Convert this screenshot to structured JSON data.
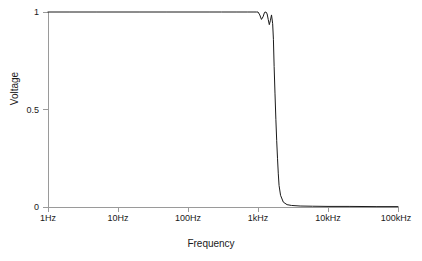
{
  "chart_data": {
    "type": "line",
    "title": "",
    "xlabel": "Frequency",
    "ylabel": "Voltage",
    "xscale": "log",
    "xlim": [
      1,
      100000
    ],
    "ylim": [
      0,
      1
    ],
    "grid": false,
    "legend": null,
    "xtick_labels": [
      "1Hz",
      "10Hz",
      "100Hz",
      "1kHz",
      "10kHz",
      "100kHz"
    ],
    "xtick_values": [
      1,
      10,
      100,
      1000,
      10000,
      100000
    ],
    "ytick_labels": [
      "0",
      "0.5",
      "1"
    ],
    "ytick_values": [
      0,
      0.5,
      1
    ],
    "line_color": "#1a1a1a",
    "line_width": 1,
    "series": [
      {
        "name": "Voltage response",
        "x": [
          1,
          2,
          5,
          10,
          20,
          50,
          100,
          200,
          300,
          500,
          700,
          850,
          950,
          1000,
          1060,
          1120,
          1180,
          1240,
          1300,
          1350,
          1400,
          1450,
          1500,
          1560,
          1620,
          1660,
          1700,
          1750,
          1800,
          1850,
          1900,
          1950,
          2000,
          2100,
          2300,
          2600,
          3000,
          4000,
          6000,
          10000,
          20000,
          50000,
          100000
        ],
        "y": [
          1.0,
          1.0,
          1.0,
          1.0,
          1.0,
          1.0,
          1.0,
          1.0,
          1.0,
          1.0,
          1.0,
          1.0,
          1.0,
          1.0,
          0.985,
          0.962,
          0.975,
          0.998,
          1.0,
          0.99,
          0.962,
          0.935,
          0.955,
          0.985,
          0.94,
          0.86,
          0.72,
          0.58,
          0.45,
          0.34,
          0.25,
          0.17,
          0.11,
          0.06,
          0.025,
          0.012,
          0.008,
          0.005,
          0.004,
          0.003,
          0.003,
          0.002,
          0.002
        ]
      }
    ],
    "annotations": []
  },
  "axis": {
    "x_title": "Frequency",
    "y_title": "Voltage"
  }
}
